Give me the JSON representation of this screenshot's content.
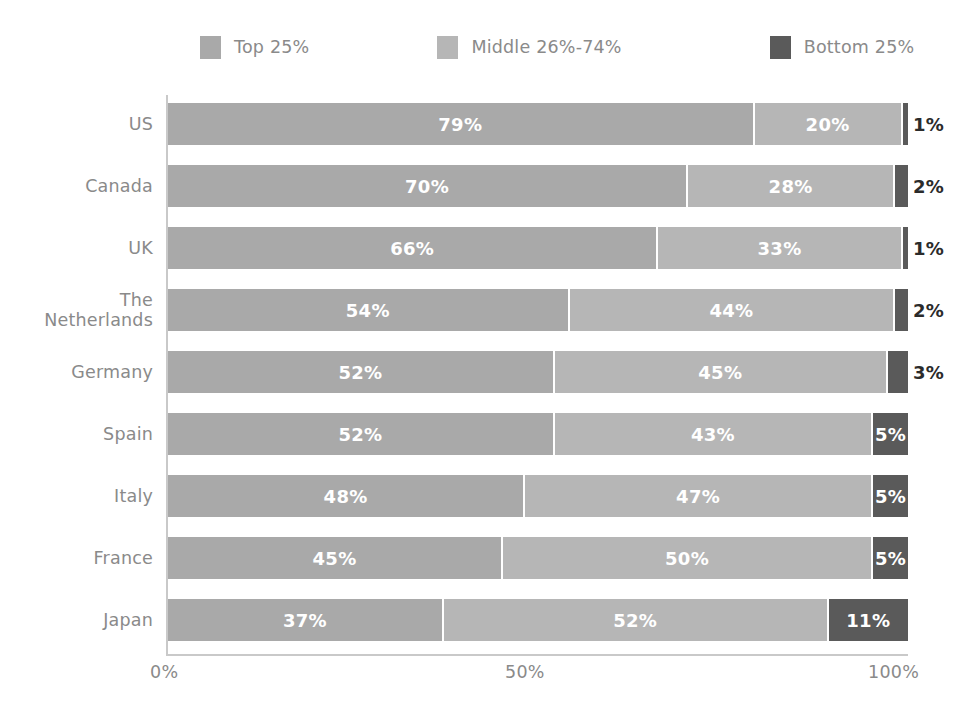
{
  "legend": {
    "items": [
      {
        "label": "Top 25%",
        "color": "#a9a9a9",
        "icon": "legend-swatch-icon"
      },
      {
        "label": "Middle 26%-74%",
        "color": "#b6b6b6",
        "icon": "legend-swatch-icon"
      },
      {
        "label": "Bottom 25%",
        "color": "#5a5a5a",
        "icon": "legend-swatch-icon"
      }
    ]
  },
  "axis": {
    "x_ticks": [
      "0%",
      "50%",
      "100%"
    ]
  },
  "chart_data": {
    "type": "bar",
    "title": "",
    "subtitle": "",
    "xlabel": "",
    "ylabel": "",
    "orientation": "horizontal",
    "stacked": true,
    "stack_total": 100,
    "xlim": [
      0,
      100
    ],
    "grid": false,
    "legend_position": "top",
    "categories": [
      "US",
      "Canada",
      "UK",
      "The\nNetherlands",
      "Germany",
      "Spain",
      "Italy",
      "France",
      "Japan"
    ],
    "series": [
      {
        "name": "Top 25%",
        "color": "#a9a9a9",
        "values": [
          79,
          70,
          66,
          54,
          52,
          52,
          48,
          45,
          37
        ]
      },
      {
        "name": "Middle 26%-74%",
        "color": "#b6b6b6",
        "values": [
          20,
          28,
          33,
          44,
          45,
          43,
          47,
          50,
          52
        ]
      },
      {
        "name": "Bottom 25%",
        "color": "#5a5a5a",
        "values": [
          1,
          2,
          1,
          2,
          3,
          5,
          5,
          5,
          11
        ]
      }
    ],
    "tick_labels_x": [
      "0%",
      "50%",
      "100%"
    ],
    "data_labels": [
      {
        "category": "US",
        "top": "79%",
        "middle": "20%",
        "bottom": "1%",
        "bottom_label_outside": true
      },
      {
        "category": "Canada",
        "top": "70%",
        "middle": "28%",
        "bottom": "2%",
        "bottom_label_outside": true
      },
      {
        "category": "UK",
        "top": "66%",
        "middle": "33%",
        "bottom": "1%",
        "bottom_label_outside": true
      },
      {
        "category": "The Netherlands",
        "top": "54%",
        "middle": "44%",
        "bottom": "2%",
        "bottom_label_outside": true
      },
      {
        "category": "Germany",
        "top": "52%",
        "middle": "45%",
        "bottom": "3%",
        "bottom_label_outside": true
      },
      {
        "category": "Spain",
        "top": "52%",
        "middle": "43%",
        "bottom": "5%",
        "bottom_label_outside": false
      },
      {
        "category": "Italy",
        "top": "48%",
        "middle": "47%",
        "bottom": "5%",
        "bottom_label_outside": false
      },
      {
        "category": "France",
        "top": "45%",
        "middle": "50%",
        "bottom": "5%",
        "bottom_label_outside": false
      },
      {
        "category": "Japan",
        "top": "37%",
        "middle": "52%",
        "bottom": "11%",
        "bottom_label_outside": false
      }
    ]
  }
}
